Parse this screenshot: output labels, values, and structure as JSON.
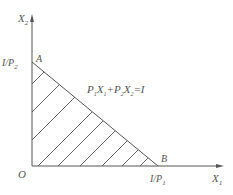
{
  "diagram": {
    "type": "budget-constraint",
    "axes": {
      "y_label": "X",
      "y_label_sub": "2",
      "x_label": "X",
      "x_label_sub": "1",
      "origin_label": "O"
    },
    "points": {
      "a_label": "A",
      "b_label": "B"
    },
    "intercepts": {
      "y_intercept_main": "I/P",
      "y_intercept_sub": "2",
      "x_intercept_main": "I/P",
      "x_intercept_sub": "1"
    },
    "equation": {
      "p1": "P",
      "p1_sub": "1",
      "x1": "X",
      "x1_sub": "1",
      "plus": "+",
      "p2": "P",
      "p2_sub": "2",
      "x2": "X",
      "x2_sub": "2",
      "rhs": "=I"
    },
    "colors": {
      "line": "#555555",
      "text": "#555555"
    }
  }
}
